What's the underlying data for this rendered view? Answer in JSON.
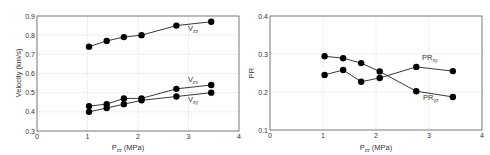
{
  "chart_data": [
    {
      "type": "line",
      "title": "",
      "xlabel": "P_zz (MPa)",
      "ylabel": "Velocity (km/s)",
      "xlim": [
        0,
        4
      ],
      "ylim": [
        0.3,
        0.9
      ],
      "xticks": [
        0,
        1,
        2,
        3,
        4
      ],
      "yticks": [
        0.3,
        0.4,
        0.5,
        0.6,
        0.7,
        0.8,
        0.9
      ],
      "grid": true,
      "x": [
        1.03,
        1.38,
        1.72,
        2.07,
        2.76,
        3.45
      ],
      "series": [
        {
          "name": "V_zz",
          "values": [
            0.74,
            0.77,
            0.79,
            0.8,
            0.85,
            0.87
          ]
        },
        {
          "name": "V_zx",
          "values": [
            0.43,
            0.44,
            0.47,
            0.47,
            0.52,
            0.54
          ]
        },
        {
          "name": "V_zy",
          "values": [
            0.4,
            0.42,
            0.44,
            0.46,
            0.48,
            0.5
          ]
        }
      ]
    },
    {
      "type": "line",
      "title": "",
      "xlabel": "P_zz (MPa)",
      "ylabel": "PR",
      "xlim": [
        0,
        4
      ],
      "ylim": [
        0.1,
        0.4
      ],
      "xticks": [
        0,
        1,
        2,
        3,
        4
      ],
      "yticks": [
        0.1,
        0.2,
        0.3,
        0.4
      ],
      "grid": true,
      "x": [
        1.03,
        1.38,
        1.72,
        2.07,
        2.76,
        3.45
      ],
      "series": [
        {
          "name": "PR_xy",
          "values": [
            0.245,
            0.258,
            0.227,
            0.237,
            0.266,
            0.255
          ]
        },
        {
          "name": "PR_yz",
          "values": [
            0.294,
            0.289,
            0.276,
            0.254,
            0.202,
            0.187
          ]
        }
      ]
    }
  ],
  "labels": {
    "left_xlabel": "P",
    "left_xlabel_sub": "zz",
    "left_xlabel_unit": " (MPa)",
    "left_ylabel": "Velocity (km/s)",
    "right_xlabel": "P",
    "right_xlabel_sub": "zz",
    "right_xlabel_unit": " (MPa)",
    "right_ylabel": "PR",
    "v1": "V",
    "v1_sub": "zz",
    "v2": "V",
    "v2_sub": "zx",
    "v3": "V",
    "v3_sub": "zy",
    "pr1": "PR",
    "pr1_sub": "xy",
    "pr2": "PR",
    "pr2_sub": "yz"
  }
}
